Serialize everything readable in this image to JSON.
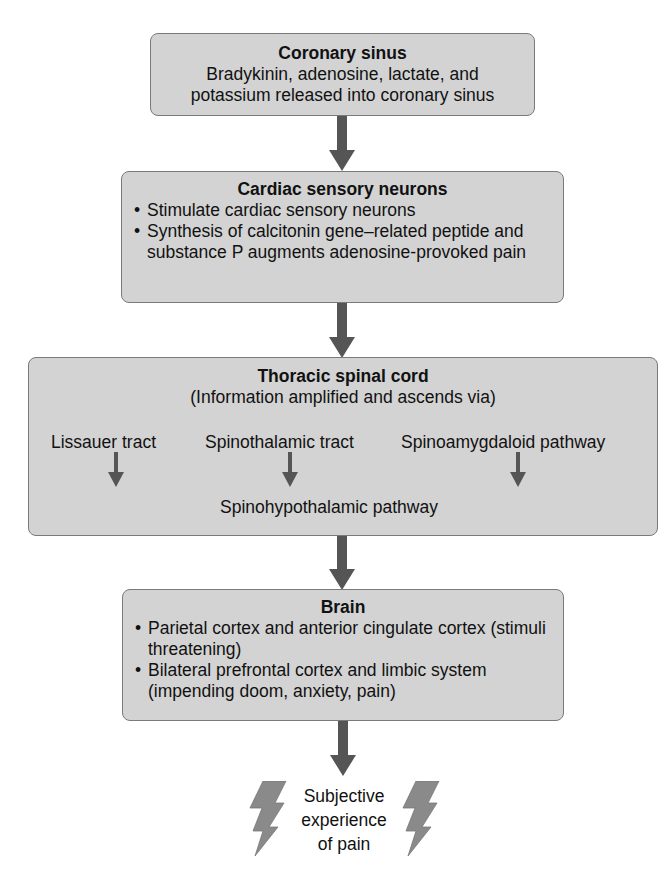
{
  "colors": {
    "box_fill": "#d3d3d3",
    "box_border": "#7a7a7a",
    "arrow": "#555555",
    "bolt": "#8a8a8a",
    "text": "#111111"
  },
  "nodes": {
    "coronary_sinus": {
      "title": "Coronary sinus",
      "lines": [
        "Bradykinin, adenosine, lactate, and",
        "potassium released into coronary sinus"
      ]
    },
    "cardiac_sensory_neurons": {
      "title": "Cardiac sensory neurons",
      "bullets": [
        "Stimulate cardiac sensory neurons",
        "Synthesis of calcitonin gene–related peptide and substance P augments adenosine-provoked pain"
      ]
    },
    "thoracic_spinal_cord": {
      "title": "Thoracic spinal cord",
      "subtitle": "(Information amplified and ascends via)",
      "tracts": [
        "Lissauer tract",
        "Spinothalamic tract",
        "Spinoamygdaloid pathway"
      ],
      "merged_pathway": "Spinohypothalamic pathway"
    },
    "brain": {
      "title": "Brain",
      "bullets": [
        "Parietal cortex and anterior cingulate cortex (stimuli threatening)",
        "Bilateral prefrontal cortex and limbic system (impending doom, anxiety, pain)"
      ]
    },
    "outcome": {
      "lines": [
        "Subjective",
        "experience",
        "of pain"
      ],
      "icon": "lightning-bolt-icon"
    }
  },
  "edges": [
    {
      "from": "coronary_sinus",
      "to": "cardiac_sensory_neurons"
    },
    {
      "from": "cardiac_sensory_neurons",
      "to": "thoracic_spinal_cord"
    },
    {
      "from": "thoracic_spinal_cord",
      "to": "brain"
    },
    {
      "from": "brain",
      "to": "outcome"
    }
  ]
}
